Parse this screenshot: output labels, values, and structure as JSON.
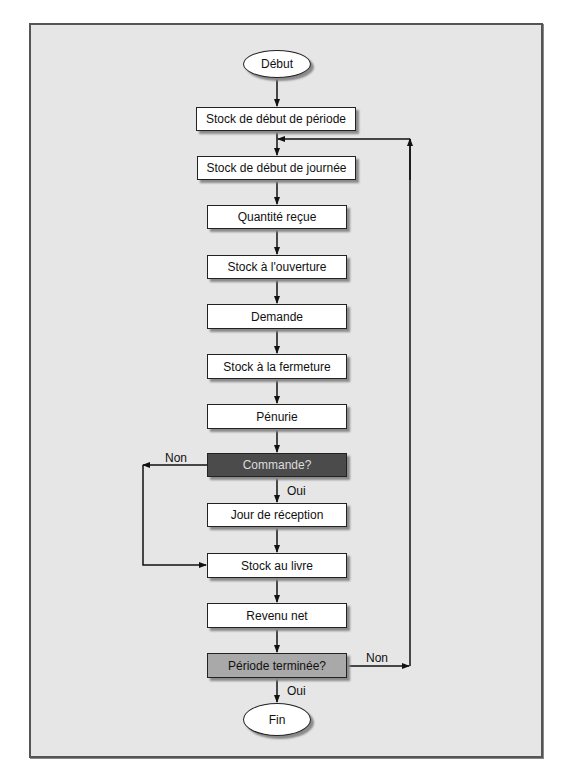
{
  "diagram": {
    "type": "flowchart",
    "nodes": {
      "start": "Début",
      "stock_debut_periode": "Stock de début de période",
      "stock_debut_journee": "Stock de début de journée",
      "quantite_recue": "Quantité reçue",
      "stock_ouverture": "Stock à l'ouverture",
      "demande": "Demande",
      "stock_fermeture": "Stock à la fermeture",
      "penurie": "Pénurie",
      "commande": "Commande?",
      "jour_reception": "Jour de réception",
      "stock_livre": "Stock au livre",
      "revenu_net": "Revenu net",
      "periode_terminee": "Période terminée?",
      "end": "Fin"
    },
    "edge_labels": {
      "commande_non": "Non",
      "commande_oui": "Oui",
      "periode_non": "Non",
      "periode_oui": "Oui"
    },
    "colors": {
      "background": "#e6e6e6",
      "decision_dark": "#4b4b4b",
      "decision_mid": "#a9a9a9",
      "process": "#ffffff"
    }
  }
}
